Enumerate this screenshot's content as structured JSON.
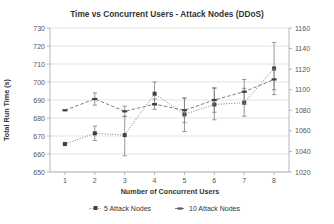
{
  "chart_data": {
    "type": "line",
    "title": "Time vs Concurrent Users - Attack Nodes (DDoS)",
    "xlabel": "Number of Concurrent Users",
    "ylabel": "Total Run Time (s)",
    "y2label": "",
    "grid": true,
    "legend_position": "bottom",
    "categories": [
      1,
      2,
      3,
      4,
      5,
      6,
      7,
      8
    ],
    "x": [
      1,
      2,
      3,
      4,
      5,
      6,
      7,
      8
    ],
    "xlim": [
      0.5,
      8.5
    ],
    "ylim": [
      650,
      730
    ],
    "yticks": [
      650,
      660,
      670,
      680,
      690,
      700,
      710,
      720,
      730
    ],
    "y2lim": [
      1020,
      1160
    ],
    "y2ticks": [
      1020,
      1040,
      1060,
      1080,
      1100,
      1120,
      1140,
      1160
    ],
    "xticks": [
      1,
      2,
      3,
      4,
      5,
      6,
      7,
      8
    ],
    "series": [
      {
        "name": "5 Attack Nodes",
        "axis": "left",
        "marker": "square",
        "linestyle": "dotted",
        "color": "#404040",
        "values": [
          665.5,
          671.5,
          670.5,
          693.5,
          682.0,
          687.5,
          688.5,
          707.5
        ],
        "error_low": [
          665.5,
          667.5,
          659.0,
          687.0,
          672.5,
          679.0,
          681.0,
          693.0
        ],
        "error_high": [
          666.5,
          675.5,
          681.0,
          700.0,
          691.0,
          696.5,
          696.5,
          722.0
        ]
      },
      {
        "name": "10 Attack Nodes",
        "axis": "right",
        "marker": "dash",
        "linestyle": "dashed",
        "color": "#595959",
        "values": [
          1080.0,
          1091.0,
          1079.0,
          1086.0,
          1080.0,
          1090.0,
          1098.0,
          1110.0
        ],
        "error_low": [
          1080.0,
          1085.0,
          1074.0,
          1081.0,
          1068.0,
          1078.0,
          1086.0,
          1100.0
        ],
        "error_high": [
          1080.0,
          1097.0,
          1084.0,
          1091.0,
          1092.0,
          1102.0,
          1110.0,
          1120.0
        ]
      }
    ]
  },
  "legend": {
    "items": [
      {
        "label": "5 Attack Nodes",
        "marker": "square-dotted"
      },
      {
        "label": "10 Attack Nodes",
        "marker": "dash-dashed"
      }
    ]
  }
}
